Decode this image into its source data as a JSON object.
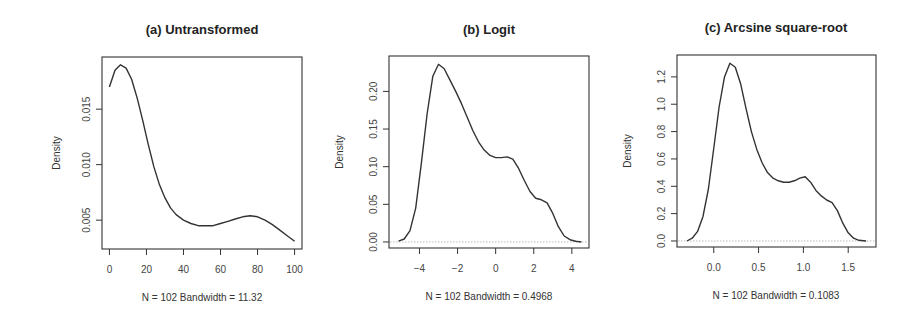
{
  "figure": {
    "panels": [
      {
        "id": "a",
        "title": "(a) Untransformed",
        "ylabel": "Density",
        "xlabel": "N = 102   Bandwidth = 11.32"
      },
      {
        "id": "b",
        "title": "(b) Logit",
        "ylabel": "Density",
        "xlabel": "N = 102   Bandwidth = 0.4968"
      },
      {
        "id": "c",
        "title": "(c) Arcsine square-root",
        "ylabel": "Density",
        "xlabel": "N = 102   Bandwidth = 0.1083"
      }
    ]
  },
  "chart_data": [
    {
      "type": "line",
      "title": "(a) Untransformed",
      "xlabel": "N = 102   Bandwidth = 11.32",
      "ylabel": "Density",
      "n": 102,
      "bandwidth": 11.32,
      "xticks": [
        0,
        20,
        40,
        60,
        80,
        100
      ],
      "yticks": [
        0.005,
        0.01,
        0.015
      ],
      "ytick_labels": [
        "0.005",
        "0.010",
        "0.015"
      ],
      "xlim": [
        -4,
        104
      ],
      "ylim": [
        0.0024,
        0.0197
      ],
      "zero_line": false,
      "grid": false,
      "box": {
        "left": 102,
        "top": 57,
        "right": 302,
        "bottom": 249
      },
      "x": [
        0,
        3,
        6,
        9,
        12,
        15,
        18,
        21,
        24,
        27,
        30,
        33,
        36,
        40,
        44,
        48,
        52,
        56,
        60,
        64,
        68,
        72,
        76,
        80,
        84,
        88,
        92,
        96,
        100
      ],
      "y": [
        0.017,
        0.0185,
        0.019,
        0.0187,
        0.0177,
        0.016,
        0.014,
        0.0118,
        0.0098,
        0.0082,
        0.007,
        0.0061,
        0.0055,
        0.005,
        0.0047,
        0.0045,
        0.0045,
        0.0045,
        0.0047,
        0.0049,
        0.0051,
        0.0053,
        0.0054,
        0.0053,
        0.005,
        0.0046,
        0.0041,
        0.0036,
        0.0031
      ]
    },
    {
      "type": "line",
      "title": "(b) Logit",
      "xlabel": "N = 102   Bandwidth = 0.4968",
      "ylabel": "Density",
      "n": 102,
      "bandwidth": 0.4968,
      "xticks": [
        -4,
        -2,
        0,
        2,
        4
      ],
      "yticks": [
        0.0,
        0.05,
        0.1,
        0.15,
        0.2
      ],
      "ytick_labels": [
        "0.00",
        "0.05",
        "0.10",
        "0.15",
        "0.20"
      ],
      "xlim": [
        -5.6,
        4.9
      ],
      "ylim": [
        -0.008,
        0.247
      ],
      "zero_line": true,
      "grid": false,
      "box": {
        "left": 389,
        "top": 56,
        "right": 589,
        "bottom": 248
      },
      "x": [
        -5.1,
        -4.8,
        -4.5,
        -4.2,
        -3.9,
        -3.6,
        -3.3,
        -3.0,
        -2.7,
        -2.4,
        -2.1,
        -1.8,
        -1.5,
        -1.2,
        -0.9,
        -0.6,
        -0.3,
        0.0,
        0.3,
        0.6,
        0.9,
        1.2,
        1.5,
        1.8,
        2.1,
        2.4,
        2.7,
        3.0,
        3.3,
        3.6,
        3.9,
        4.2,
        4.5
      ],
      "y": [
        0.001,
        0.004,
        0.015,
        0.045,
        0.105,
        0.17,
        0.22,
        0.236,
        0.23,
        0.215,
        0.2,
        0.184,
        0.166,
        0.148,
        0.133,
        0.122,
        0.115,
        0.112,
        0.112,
        0.113,
        0.11,
        0.098,
        0.082,
        0.067,
        0.058,
        0.056,
        0.052,
        0.038,
        0.02,
        0.008,
        0.003,
        0.001,
        0.0
      ]
    },
    {
      "type": "line",
      "title": "(c) Arcsine square-root",
      "xlabel": "N = 102   Bandwidth = 0.1083",
      "ylabel": "Density",
      "n": 102,
      "bandwidth": 0.1083,
      "xticks": [
        0.0,
        0.5,
        1.0,
        1.5
      ],
      "xtick_labels": [
        "0.0",
        "0.5",
        "1.0",
        "1.5"
      ],
      "yticks": [
        0.0,
        0.2,
        0.4,
        0.6,
        0.8,
        1.0,
        1.2
      ],
      "ytick_labels": [
        "0.0",
        "0.2",
        "0.4",
        "0.6",
        "0.8",
        "1.0",
        "1.2"
      ],
      "xlim": [
        -0.41,
        1.81
      ],
      "ylim": [
        -0.044,
        1.36
      ],
      "zero_line": true,
      "grid": false,
      "box": {
        "left": 677,
        "top": 55,
        "right": 876,
        "bottom": 247
      },
      "x": [
        -0.3,
        -0.24,
        -0.18,
        -0.12,
        -0.06,
        0.0,
        0.06,
        0.12,
        0.18,
        0.24,
        0.3,
        0.36,
        0.42,
        0.48,
        0.54,
        0.6,
        0.66,
        0.72,
        0.78,
        0.84,
        0.9,
        0.96,
        1.02,
        1.08,
        1.14,
        1.2,
        1.26,
        1.32,
        1.38,
        1.44,
        1.5,
        1.56,
        1.62,
        1.7
      ],
      "y": [
        0.0,
        0.02,
        0.07,
        0.18,
        0.38,
        0.68,
        0.98,
        1.2,
        1.3,
        1.27,
        1.15,
        0.97,
        0.8,
        0.67,
        0.57,
        0.5,
        0.46,
        0.44,
        0.43,
        0.43,
        0.44,
        0.46,
        0.47,
        0.43,
        0.37,
        0.33,
        0.3,
        0.28,
        0.22,
        0.13,
        0.06,
        0.02,
        0.005,
        0.0
      ]
    }
  ]
}
